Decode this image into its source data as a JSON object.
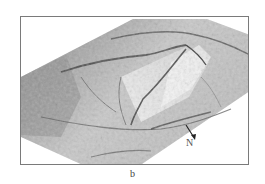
{
  "figure": {
    "panel_label": "b",
    "north_arrow": {
      "label": "N",
      "icon": "north-arrow-icon"
    },
    "image_description": "3D shaded relief terrain model (grayscale) shown in oblique perspective",
    "colors": {
      "frame": "#7a7a7a",
      "terrain_dark": "#5a5a5a",
      "terrain_light": "#f2f2f2",
      "background": "#ffffff"
    }
  }
}
